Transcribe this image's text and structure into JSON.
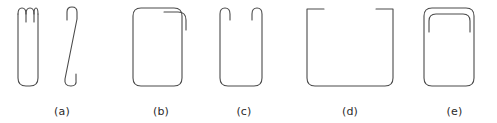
{
  "figure": {
    "name": "wire-form-shapes-figure",
    "background_color": "#ffffff",
    "stroke_color": "#4a4a4a",
    "stroke_width": 1.1,
    "caption_color": "#2b2b2b"
  },
  "panels": [
    {
      "id": "a",
      "label": "(a)",
      "shape_name": "straight-bar-and-slanted-s-hook-pair",
      "description": "Two separate wire elements: a narrow vertical rounded bar with a small double prong at its top, and a slanted S-shaped wire with hooks at top and bottom",
      "element_count": 2
    },
    {
      "id": "b",
      "label": "(b)",
      "shape_name": "closed-rounded-rectangle-with-overlap-hook",
      "description": "Closed rounded rectangular loop with an overlapping wire end curling down at the top right corner",
      "element_count": 1
    },
    {
      "id": "c",
      "label": "(c)",
      "shape_name": "open-u-frame-with-inward-end-hooks",
      "description": "U shaped open frame with small inverted hooks curling inward at both upper ends",
      "element_count": 1
    },
    {
      "id": "d",
      "label": "(d)",
      "shape_name": "wide-open-bracket-with-top-flanges",
      "description": "Wide open bracket with short horizontal flanges turning inward at both top corners",
      "element_count": 1
    },
    {
      "id": "e",
      "label": "(e)",
      "shape_name": "rounded-rectangle-with-nested-inner-arc",
      "description": "Closed rounded rectangle with a second nested rounded top line inside the upper portion",
      "element_count": 1
    }
  ]
}
